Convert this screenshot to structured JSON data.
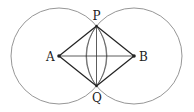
{
  "diagram": {
    "type": "geometric-construction",
    "points": {
      "A": {
        "label": "A",
        "x": 59,
        "y": 56
      },
      "B": {
        "label": "B",
        "x": 134,
        "y": 56
      },
      "P": {
        "label": "P",
        "x": 96.5,
        "y": 26
      },
      "Q": {
        "label": "Q",
        "x": 96.5,
        "y": 86
      }
    },
    "circles": [
      {
        "center": "A",
        "radius": 48
      },
      {
        "center": "B",
        "radius": 48
      }
    ],
    "segments": [
      [
        "A",
        "P"
      ],
      [
        "P",
        "B"
      ],
      [
        "B",
        "Q"
      ],
      [
        "Q",
        "A"
      ],
      [
        "A",
        "B"
      ],
      [
        "P",
        "Q"
      ]
    ],
    "arcs": [
      {
        "through": [
          "P",
          "Q"
        ],
        "radius": 50,
        "side": "left"
      },
      {
        "through": [
          "P",
          "Q"
        ],
        "radius": 50,
        "side": "right"
      }
    ],
    "colors": {
      "circle": "#8a8a8a",
      "line": "#222222",
      "text": "#222222"
    }
  }
}
